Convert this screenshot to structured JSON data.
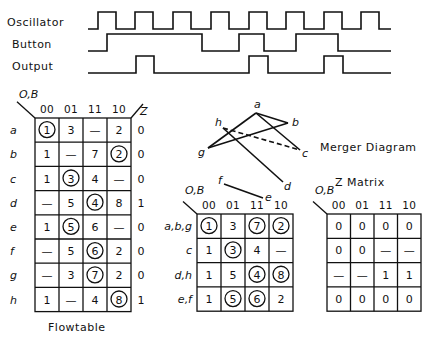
{
  "timing_diagram": {
    "signals": [
      {
        "name": "Oscillator",
        "x_start": 88,
        "x_end": 391,
        "y_low": 29,
        "y_high": 12,
        "edges": [
          98,
          116,
          135,
          153,
          173,
          191,
          211,
          229,
          249,
          267,
          286,
          304,
          324,
          342,
          361,
          379
        ],
        "initial": 0
      },
      {
        "name": "Button",
        "x_start": 88,
        "x_end": 391,
        "y_low": 51,
        "y_high": 34,
        "edges": [
          107,
          202,
          239,
          264,
          296,
          338
        ],
        "initial": 0
      },
      {
        "name": "Output",
        "x_start": 88,
        "x_end": 391,
        "y_low": 73,
        "y_high": 56,
        "edges": [
          136,
          154,
          249,
          268,
          324,
          343
        ],
        "initial": 0
      }
    ]
  },
  "flowtable": {
    "title": "Flowtable",
    "input_label": "O,B",
    "output_label": "Z",
    "columns": [
      "00",
      "01",
      "11",
      "10"
    ],
    "rows": [
      {
        "state": "a",
        "cells": [
          {
            "v": "1",
            "stable": true
          },
          {
            "v": "3"
          },
          {
            "v": "—"
          },
          {
            "v": "2"
          }
        ],
        "z": "0"
      },
      {
        "state": "b",
        "cells": [
          {
            "v": "1"
          },
          {
            "v": "—"
          },
          {
            "v": "7"
          },
          {
            "v": "2",
            "stable": true
          }
        ],
        "z": "0"
      },
      {
        "state": "c",
        "cells": [
          {
            "v": "1"
          },
          {
            "v": "3",
            "stable": true
          },
          {
            "v": "4"
          },
          {
            "v": "—"
          }
        ],
        "z": "0"
      },
      {
        "state": "d",
        "cells": [
          {
            "v": "—"
          },
          {
            "v": "5"
          },
          {
            "v": "4",
            "stable": true
          },
          {
            "v": "8"
          }
        ],
        "z": "1"
      },
      {
        "state": "e",
        "cells": [
          {
            "v": "1"
          },
          {
            "v": "5",
            "stable": true
          },
          {
            "v": "6"
          },
          {
            "v": "—"
          }
        ],
        "z": "0"
      },
      {
        "state": "f",
        "cells": [
          {
            "v": "—"
          },
          {
            "v": "5"
          },
          {
            "v": "6",
            "stable": true
          },
          {
            "v": "2"
          }
        ],
        "z": "0"
      },
      {
        "state": "g",
        "cells": [
          {
            "v": "—"
          },
          {
            "v": "3"
          },
          {
            "v": "7",
            "stable": true
          },
          {
            "v": "2"
          }
        ],
        "z": "0"
      },
      {
        "state": "h",
        "cells": [
          {
            "v": "1"
          },
          {
            "v": "—"
          },
          {
            "v": "4"
          },
          {
            "v": "8",
            "stable": true
          }
        ],
        "z": "1"
      }
    ]
  },
  "merger_diagram": {
    "title": "Merger Diagram",
    "nodes": [
      {
        "id": "a",
        "x": 256,
        "y": 113,
        "lx": 254,
        "ly": 108
      },
      {
        "id": "b",
        "x": 288,
        "y": 123,
        "lx": 292,
        "ly": 126
      },
      {
        "id": "c",
        "x": 300,
        "y": 150,
        "lx": 302,
        "ly": 157
      },
      {
        "id": "h",
        "x": 223,
        "y": 128,
        "lx": 215,
        "ly": 126
      },
      {
        "id": "g",
        "x": 208,
        "y": 148,
        "lx": 198,
        "ly": 156
      },
      {
        "id": "d",
        "x": 283,
        "y": 182,
        "lx": 284,
        "ly": 190
      },
      {
        "id": "f",
        "x": 224,
        "y": 184,
        "lx": 218,
        "ly": 184
      },
      {
        "id": "e",
        "x": 263,
        "y": 198,
        "lx": 265,
        "ly": 201
      }
    ],
    "edges": [
      {
        "from": "a",
        "to": "b",
        "dashed": false
      },
      {
        "from": "a",
        "to": "g",
        "dashed": false
      },
      {
        "from": "a",
        "to": "c",
        "dashed": false
      },
      {
        "from": "g",
        "to": "b",
        "dashed": false
      },
      {
        "from": "h",
        "to": "d",
        "dashed": false
      },
      {
        "from": "h",
        "to": "c",
        "dashed": true
      },
      {
        "from": "f",
        "to": "e",
        "dashed": false
      }
    ]
  },
  "merged_flowtable": {
    "input_label": "O,B",
    "columns": [
      "00",
      "01",
      "11",
      "10"
    ],
    "rows": [
      {
        "state": "a,b,g",
        "cells": [
          {
            "v": "1",
            "stable": true
          },
          {
            "v": "3"
          },
          {
            "v": "7",
            "stable": true
          },
          {
            "v": "2",
            "stable": true
          }
        ]
      },
      {
        "state": "c",
        "cells": [
          {
            "v": "1"
          },
          {
            "v": "3",
            "stable": true
          },
          {
            "v": "4"
          },
          {
            "v": "—"
          }
        ]
      },
      {
        "state": "d,h",
        "cells": [
          {
            "v": "1"
          },
          {
            "v": "5"
          },
          {
            "v": "4",
            "stable": true
          },
          {
            "v": "8",
            "stable": true
          }
        ]
      },
      {
        "state": "e,f",
        "cells": [
          {
            "v": "1"
          },
          {
            "v": "5",
            "stable": true
          },
          {
            "v": "6",
            "stable": true
          },
          {
            "v": "2"
          }
        ]
      }
    ]
  },
  "z_matrix": {
    "title": "Z  Matrix",
    "input_label": "O,B",
    "columns": [
      "00",
      "01",
      "11",
      "10"
    ],
    "rows": [
      [
        "0",
        "0",
        "0",
        "0"
      ],
      [
        "0",
        "0",
        "—",
        "—"
      ],
      [
        "—",
        "—",
        "1",
        "1"
      ],
      [
        "0",
        "0",
        "0",
        "0"
      ]
    ]
  }
}
